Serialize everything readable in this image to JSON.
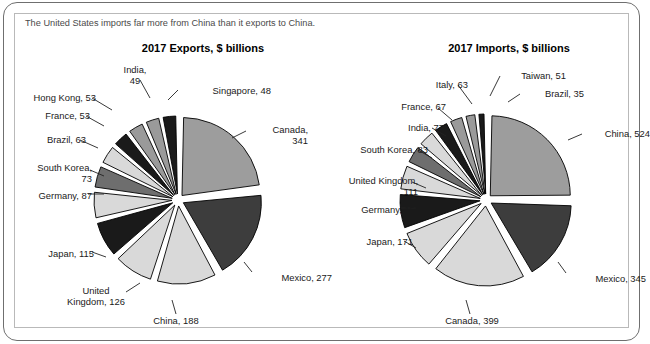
{
  "figure": {
    "caption": "The United States imports far more from China than it exports to China.",
    "border_color": "#6f6f6f",
    "inner_border_color": "#b9b9b9"
  },
  "palette": {
    "light": "#d9d9d9",
    "medium": "#9a9a9a",
    "dark": "#3a3a3a",
    "black": "#1a1a1a",
    "mid_light": "#c4c4c4",
    "mid_dark": "#6e6e6e",
    "canada_gray": "#9d9d9d",
    "mexico_gray": "#3d3d3d"
  },
  "chart_data": [
    {
      "type": "pie",
      "id": "exports",
      "title": "2017 Exports, $ billions",
      "unit": "$ billions",
      "year": "2017",
      "total": 1373,
      "categories": [
        "Canada",
        "Mexico",
        "China",
        "United Kingdom",
        "Japan",
        "Germany",
        "South Korea",
        "Brazil",
        "France",
        "Hong Kong",
        "India",
        "Singapore"
      ],
      "values": [
        341,
        277,
        188,
        126,
        115,
        87,
        73,
        63,
        53,
        53,
        49,
        48
      ],
      "labels": [
        "Canada,\n341",
        "Mexico, 277",
        "China, 188",
        "United\nKingdom, 126",
        "Japan, 115",
        "Germany, 87",
        "South Korea,\n73",
        "Brazil, 63",
        "France, 53",
        "Hong Kong, 53",
        "India,\n49",
        "Singapore, 48"
      ],
      "xlabel": "",
      "ylabel": "",
      "legend": "none",
      "exploded": true
    },
    {
      "type": "pie",
      "id": "imports",
      "title": "2017 Imports, $ billions",
      "unit": "$ billions",
      "year": "2017",
      "total": 2079,
      "categories": [
        "China",
        "Mexico",
        "Canada",
        "Japan",
        "Germany",
        "United Kingdom",
        "South Korea",
        "India",
        "France",
        "Italy",
        "Taiwan",
        "Brazil"
      ],
      "values": [
        524,
        345,
        399,
        171,
        153,
        111,
        83,
        77,
        67,
        63,
        51,
        35
      ],
      "labels": [
        "China, 524",
        "Mexico, 345",
        "Canada, 399",
        "Japan, 171",
        "Germany, 153",
        "United Kingdom,\n111",
        "South Korea, 83",
        "India, 77",
        "France, 67",
        "Italy, 63",
        "Taiwan, 51",
        "Brazil, 35"
      ],
      "xlabel": "",
      "ylabel": "",
      "legend": "none",
      "exploded": true
    }
  ],
  "labels": {
    "exports": {
      "canada": "Canada,\n341",
      "mexico": "Mexico, 277",
      "china": "China, 188",
      "uk": "United\nKingdom, 126",
      "japan": "Japan, 115",
      "germany": "Germany, 87",
      "south_korea": "South Korea,\n73",
      "brazil": "Brazil, 63",
      "france": "France, 53",
      "hong_kong": "Hong Kong, 53",
      "india": "India,\n49",
      "singapore": "Singapore, 48"
    },
    "imports": {
      "china": "China, 524",
      "mexico": "Mexico, 345",
      "canada": "Canada, 399",
      "japan": "Japan, 171",
      "germany": "Germany, 153",
      "uk": "United Kingdom,\n111",
      "south_korea": "South Korea, 83",
      "india": "India, 77",
      "france": "France, 67",
      "italy": "Italy, 63",
      "taiwan": "Taiwan, 51",
      "brazil": "Brazil, 35"
    }
  }
}
